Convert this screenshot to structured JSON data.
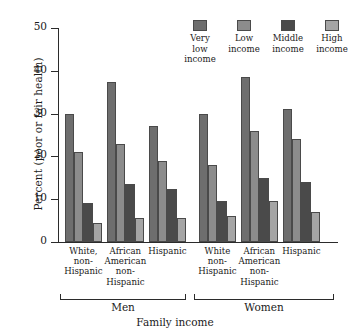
{
  "chart_data": {
    "type": "bar",
    "title": "",
    "xlabel": "Family income",
    "ylabel": "Percent (poor or fair health)",
    "ylim": [
      0,
      50
    ],
    "yticks": [
      0,
      10,
      20,
      30,
      40,
      50
    ],
    "grid": false,
    "legend_position": "top-right",
    "axis_break": true,
    "supergroups": [
      {
        "label": "Men",
        "categories": [
          0,
          1,
          2
        ]
      },
      {
        "label": "Women",
        "categories": [
          3,
          4,
          5
        ]
      }
    ],
    "categories": [
      "White,\nnon-\nHispanic",
      "African\nAmerican\nnon-\nHispanic",
      "Hispanic",
      "White\nnon-\nHispanic",
      "African\nAmerican\nnon-\nHispanic",
      "Hispanic"
    ],
    "category_lines": [
      [
        "White,",
        "non-",
        "Hispanic"
      ],
      [
        "African",
        "American",
        "non-",
        "Hispanic"
      ],
      [
        "Hispanic"
      ],
      [
        "White",
        "non-",
        "Hispanic"
      ],
      [
        "African",
        "American",
        "non-",
        "Hispanic"
      ],
      [
        "Hispanic"
      ]
    ],
    "series": [
      {
        "name": "Very low income",
        "color": "#6e6e6e",
        "values": [
          30.0,
          37.5,
          27.0,
          30.0,
          38.5,
          31.0
        ]
      },
      {
        "name": "Low income",
        "color": "#8c8c8c",
        "values": [
          21.0,
          22.8,
          19.0,
          18.0,
          26.0,
          24.0
        ]
      },
      {
        "name": "Middle income",
        "color": "#4a4a4a",
        "values": [
          9.0,
          13.5,
          12.5,
          9.5,
          15.0,
          14.0
        ]
      },
      {
        "name": "High income",
        "color": "#a5a5a5",
        "values": [
          4.5,
          5.5,
          5.5,
          6.0,
          9.5,
          7.0
        ]
      }
    ]
  },
  "legend": {
    "items": [
      {
        "line1": "Very low",
        "line2": "income",
        "color": "#6e6e6e"
      },
      {
        "line1": "Low",
        "line2": "income",
        "color": "#8c8c8c"
      },
      {
        "line1": "Middle",
        "line2": "income",
        "color": "#4a4a4a"
      },
      {
        "line1": "High",
        "line2": "income",
        "color": "#a5a5a5"
      }
    ]
  }
}
